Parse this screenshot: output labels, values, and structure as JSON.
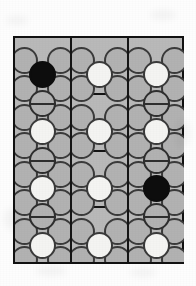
{
  "figure": {
    "background_color": "#fdfdfd",
    "panel_fill_color": "#b9b9b9",
    "line_color": "#151515",
    "cell_colors": {
      "empty": "#b2b2b2",
      "white": "#f4f4f2",
      "black": "#0d0d0d",
      "barred": "#b2b2b2",
      "outline": "#3a3a3a"
    },
    "legend": {
      "empty_label": "open circle",
      "white_label": "white filled circle",
      "black_label": "black filled circle",
      "barred_label": "circle with horizontal bar"
    },
    "geometry": {
      "diagram_left": 13,
      "diagram_top": 36,
      "diagram_width": 171,
      "diagram_height": 228,
      "panel_count": 3,
      "cell_diameter": 27,
      "row_pitch": 28.5
    },
    "panels": [
      {
        "name": "left-panel",
        "x": 0,
        "width": 55,
        "row_separators": [],
        "pairs": [
          {
            "y": 9
          },
          {
            "y": 37
          },
          {
            "y": 66
          },
          {
            "y": 94
          },
          {
            "y": 123
          },
          {
            "y": 151
          },
          {
            "y": 180
          },
          {
            "y": 208
          }
        ],
        "centers": [
          {
            "y": 23,
            "state": "black"
          },
          {
            "y": 52,
            "state": "barred"
          },
          {
            "y": 80,
            "state": "white"
          },
          {
            "y": 109,
            "state": "barred"
          },
          {
            "y": 137,
            "state": "white"
          },
          {
            "y": 165,
            "state": "barred"
          },
          {
            "y": 194,
            "state": "white"
          }
        ]
      },
      {
        "name": "middle-panel",
        "x": 57,
        "width": 55,
        "row_separators": [
          55,
          112,
          168
        ],
        "pairs": [
          {
            "y": 9
          },
          {
            "y": 37
          },
          {
            "y": 66
          },
          {
            "y": 94
          },
          {
            "y": 123
          },
          {
            "y": 151
          },
          {
            "y": 180
          },
          {
            "y": 208
          }
        ],
        "centers": [
          {
            "y": 23,
            "state": "white"
          },
          {
            "y": 80,
            "state": "white"
          },
          {
            "y": 137,
            "state": "white"
          },
          {
            "y": 194,
            "state": "white"
          }
        ]
      },
      {
        "name": "right-panel",
        "x": 114,
        "width": 55,
        "row_separators": [],
        "pairs": [
          {
            "y": 9
          },
          {
            "y": 37
          },
          {
            "y": 66
          },
          {
            "y": 94
          },
          {
            "y": 123
          },
          {
            "y": 151
          },
          {
            "y": 180
          },
          {
            "y": 208
          }
        ],
        "centers": [
          {
            "y": 23,
            "state": "white"
          },
          {
            "y": 52,
            "state": "barred"
          },
          {
            "y": 80,
            "state": "white"
          },
          {
            "y": 109,
            "state": "barred"
          },
          {
            "y": 137,
            "state": "black"
          },
          {
            "y": 165,
            "state": "barred"
          },
          {
            "y": 194,
            "state": "white"
          }
        ]
      }
    ],
    "smudges": [
      {
        "x": 6,
        "y": 16,
        "w": 22,
        "h": 9
      },
      {
        "x": 150,
        "y": 10,
        "w": 26,
        "h": 10
      },
      {
        "x": 4,
        "y": 208,
        "w": 14,
        "h": 22
      },
      {
        "x": 36,
        "y": 266,
        "w": 30,
        "h": 10
      },
      {
        "x": 130,
        "y": 268,
        "w": 26,
        "h": 9
      },
      {
        "x": 176,
        "y": 120,
        "w": 14,
        "h": 28
      }
    ]
  }
}
